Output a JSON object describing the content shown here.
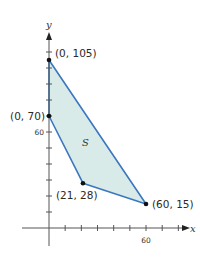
{
  "chart_data": {
    "type": "area",
    "title": "",
    "xlabel": "x",
    "ylabel": "y",
    "region_label": "S",
    "xlim": [
      0,
      60
    ],
    "ylim": [
      0,
      110
    ],
    "x_tick_step": 10,
    "y_tick_step": 10,
    "x_tick_labels": [
      {
        "value": 60,
        "label": "60"
      }
    ],
    "y_tick_labels": [
      {
        "value": 60,
        "label": "60"
      }
    ],
    "grid": false,
    "polygon": [
      {
        "x": 0,
        "y": 105,
        "label": "(0, 105)"
      },
      {
        "x": 60,
        "y": 15,
        "label": "(60, 15)"
      },
      {
        "x": 21,
        "y": 28,
        "label": "(21, 28)"
      },
      {
        "x": 0,
        "y": 70,
        "label": "(0, 70)"
      }
    ],
    "colors": {
      "fill": "#d9ebe8",
      "edge": "#3b77c0",
      "axis": "#555555",
      "point": "#111111"
    }
  }
}
